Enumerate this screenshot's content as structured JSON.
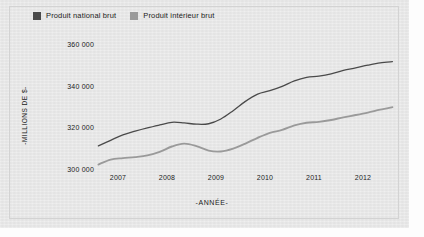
{
  "chart_data": {
    "type": "line",
    "title": "",
    "xlabel": "-ANNÉE-",
    "ylabel": "-MILLIONS DE $-",
    "xlim": [
      2006.6,
      2012.7
    ],
    "ylim": [
      296000,
      364000
    ],
    "grid": false,
    "legend_position": "top-left",
    "xtick_labels": [
      "2007",
      "2008",
      "2009",
      "2010",
      "2011",
      "2012"
    ],
    "xtick_values": [
      2007,
      2008,
      2009,
      2010,
      2011,
      2012
    ],
    "ytick_labels": [
      "360 000",
      "340 000",
      "320 000",
      "300 000"
    ],
    "ytick_values": [
      360000,
      340000,
      320000,
      300000
    ],
    "x": [
      2006.6,
      2006.85,
      2007.1,
      2007.35,
      2007.6,
      2007.85,
      2008.1,
      2008.35,
      2008.6,
      2008.85,
      2009.1,
      2009.35,
      2009.6,
      2009.85,
      2010.1,
      2010.35,
      2010.6,
      2010.85,
      2011.1,
      2011.35,
      2011.6,
      2011.85,
      2012.1,
      2012.35,
      2012.6
    ],
    "series": [
      {
        "name": "Produit national brut",
        "color": "#4a4a4a",
        "values": [
          311500,
          314200,
          316800,
          318600,
          320200,
          321600,
          322900,
          322600,
          322000,
          322200,
          324500,
          328500,
          333000,
          336500,
          338200,
          340300,
          342900,
          344600,
          345200,
          346300,
          348000,
          349200,
          350500,
          351600,
          352200
        ]
      },
      {
        "name": "Produit intérieur brut",
        "color": "#9a9a9a",
        "values": [
          302500,
          304900,
          305600,
          306100,
          306900,
          308600,
          311200,
          312600,
          311400,
          309200,
          308800,
          310200,
          312600,
          315400,
          317800,
          319200,
          321400,
          322700,
          323100,
          324000,
          325300,
          326400,
          327600,
          329000,
          330200
        ]
      }
    ]
  },
  "legend": {
    "items": [
      {
        "label": "Produit national brut",
        "color": "#4a4a4a"
      },
      {
        "label": "Produit intérieur brut",
        "color": "#9a9a9a"
      }
    ]
  },
  "axes": {
    "y_title": "-MILLIONS DE $-",
    "x_title": "-ANNÉE-",
    "y_ticks": [
      "360 000",
      "340 000",
      "320 000",
      "300 000"
    ],
    "x_ticks": [
      "2007",
      "2008",
      "2009",
      "2010",
      "2011",
      "2012"
    ]
  }
}
